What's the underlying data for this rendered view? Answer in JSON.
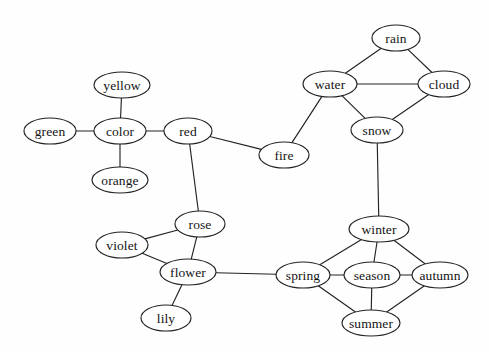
{
  "figure": {
    "type": "node-link-diagram",
    "background_color": "#fefefe",
    "stroke_color": "#232323",
    "node_fill_color": "#ffffff",
    "label_color": "#141414",
    "width": 489,
    "height": 352
  },
  "nodes": [
    {
      "id": "yellow",
      "label": "yellow",
      "cx": 122,
      "cy": 85,
      "rx": 28,
      "ry": 13
    },
    {
      "id": "green",
      "label": "green",
      "cx": 50,
      "cy": 131,
      "rx": 26,
      "ry": 13
    },
    {
      "id": "color",
      "label": "color",
      "cx": 120,
      "cy": 131,
      "rx": 26,
      "ry": 13
    },
    {
      "id": "orange",
      "label": "orange",
      "cx": 120,
      "cy": 180,
      "rx": 28,
      "ry": 13
    },
    {
      "id": "red",
      "label": "red",
      "cx": 188,
      "cy": 131,
      "rx": 24,
      "ry": 13
    },
    {
      "id": "fire",
      "label": "fire",
      "cx": 284,
      "cy": 155,
      "rx": 25,
      "ry": 13
    },
    {
      "id": "water",
      "label": "water",
      "cx": 330,
      "cy": 84,
      "rx": 27,
      "ry": 13
    },
    {
      "id": "rain",
      "label": "rain",
      "cx": 396,
      "cy": 38,
      "rx": 24,
      "ry": 13
    },
    {
      "id": "cloud",
      "label": "cloud",
      "cx": 444,
      "cy": 84,
      "rx": 26,
      "ry": 13
    },
    {
      "id": "snow",
      "label": "snow",
      "cx": 377,
      "cy": 130,
      "rx": 26,
      "ry": 13
    },
    {
      "id": "winter",
      "label": "winter",
      "cx": 379,
      "cy": 229,
      "rx": 30,
      "ry": 13
    },
    {
      "id": "spring",
      "label": "spring",
      "cx": 303,
      "cy": 275,
      "rx": 27,
      "ry": 13
    },
    {
      "id": "season",
      "label": "season",
      "cx": 372,
      "cy": 275,
      "rx": 28,
      "ry": 13
    },
    {
      "id": "autumn",
      "label": "autumn",
      "cx": 440,
      "cy": 275,
      "rx": 28,
      "ry": 13
    },
    {
      "id": "summer",
      "label": "summer",
      "cx": 371,
      "cy": 323,
      "rx": 29,
      "ry": 13
    },
    {
      "id": "rose",
      "label": "rose",
      "cx": 200,
      "cy": 224,
      "rx": 25,
      "ry": 13
    },
    {
      "id": "violet",
      "label": "violet",
      "cx": 122,
      "cy": 245,
      "rx": 26,
      "ry": 13
    },
    {
      "id": "flower",
      "label": "flower",
      "cx": 188,
      "cy": 272,
      "rx": 28,
      "ry": 13
    },
    {
      "id": "lily",
      "label": "lily",
      "cx": 166,
      "cy": 318,
      "rx": 25,
      "ry": 13
    }
  ],
  "edges": [
    {
      "source": "yellow",
      "target": "color"
    },
    {
      "source": "green",
      "target": "color"
    },
    {
      "source": "orange",
      "target": "color"
    },
    {
      "source": "color",
      "target": "red"
    },
    {
      "source": "red",
      "target": "fire"
    },
    {
      "source": "red",
      "target": "rose"
    },
    {
      "source": "fire",
      "target": "water"
    },
    {
      "source": "water",
      "target": "rain"
    },
    {
      "source": "rain",
      "target": "cloud"
    },
    {
      "source": "water",
      "target": "cloud"
    },
    {
      "source": "water",
      "target": "snow"
    },
    {
      "source": "cloud",
      "target": "snow"
    },
    {
      "source": "snow",
      "target": "winter"
    },
    {
      "source": "winter",
      "target": "spring"
    },
    {
      "source": "winter",
      "target": "season"
    },
    {
      "source": "winter",
      "target": "autumn"
    },
    {
      "source": "spring",
      "target": "season"
    },
    {
      "source": "season",
      "target": "autumn"
    },
    {
      "source": "spring",
      "target": "summer"
    },
    {
      "source": "season",
      "target": "summer"
    },
    {
      "source": "summer",
      "target": "autumn"
    },
    {
      "source": "rose",
      "target": "violet"
    },
    {
      "source": "rose",
      "target": "flower"
    },
    {
      "source": "violet",
      "target": "flower"
    },
    {
      "source": "flower",
      "target": "lily"
    },
    {
      "source": "flower",
      "target": "spring"
    }
  ]
}
